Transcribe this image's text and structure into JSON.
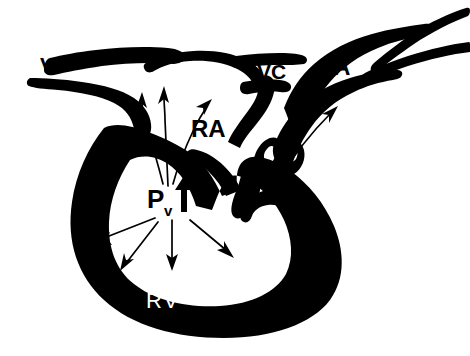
{
  "figure": {
    "background_color": "#ffffff",
    "ink_color": "#000000",
    "inverse_text_color": "#ffffff"
  },
  "labels": {
    "vena_cava_left": "VC",
    "vena_cava_right": "VC",
    "pulmonary_artery": "PA",
    "right_atrium": "RA",
    "pulmonary_stenosis": "PS",
    "right_ventricle": "RV",
    "ventricular_pressure": "P",
    "ventricular_pressure_subscript": "v"
  },
  "annotations": {
    "pressure_arrow_direction": "up",
    "regurgitant_flow_arrows": 3,
    "radiating_pressure_arrows": 4,
    "outflow_arrows": 2
  }
}
